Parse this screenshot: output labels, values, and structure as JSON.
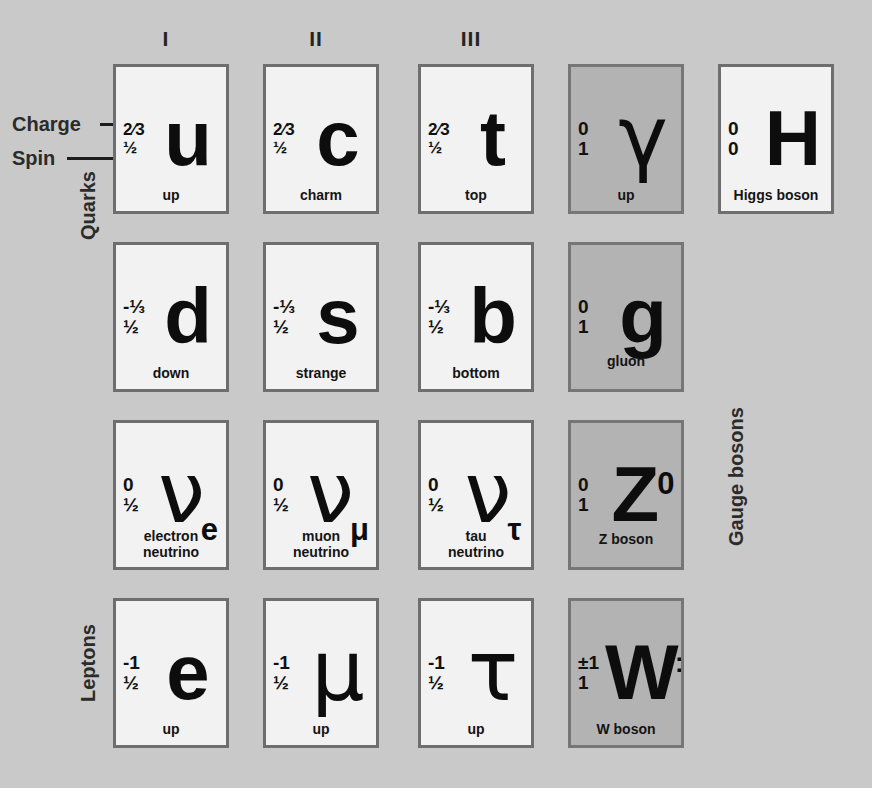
{
  "diagram": {
    "background_color": "#c9c9c9",
    "fermion_card_color": "#f2f2f2",
    "boson_card_color": "#b3b3b3",
    "border_color": "#6e6e6e"
  },
  "annotations": {
    "charge_label": "Charge",
    "spin_label": "Spin"
  },
  "group_labels": {
    "quarks": "Quarks",
    "leptons": "Leptons",
    "gauge_bosons": "Gauge bosons"
  },
  "columns": [
    {
      "header": "I"
    },
    {
      "header": "II"
    },
    {
      "header": "III"
    },
    {
      "header": ""
    },
    {
      "header": ""
    }
  ],
  "particles": [
    {
      "id": "up-quark",
      "symbol": "u",
      "sup": "",
      "sub": "",
      "charge": "2⁄3",
      "spin": "½",
      "name": "up",
      "name_line2": "",
      "type": "fermion",
      "group": "quark",
      "col": 0,
      "row": 0
    },
    {
      "id": "charm-quark",
      "symbol": "c",
      "sup": "",
      "sub": "",
      "charge": "2⁄3",
      "spin": "½",
      "name": "charm",
      "name_line2": "",
      "type": "fermion",
      "group": "quark",
      "col": 1,
      "row": 0
    },
    {
      "id": "top-quark",
      "symbol": "t",
      "sup": "",
      "sub": "",
      "charge": "2⁄3",
      "spin": "½",
      "name": "top",
      "name_line2": "",
      "type": "fermion",
      "group": "quark",
      "col": 2,
      "row": 0
    },
    {
      "id": "photon",
      "symbol": "γ",
      "sup": "",
      "sub": "",
      "charge": "0",
      "spin": "1",
      "name": "up",
      "name_line2": "",
      "type": "boson",
      "group": "gauge-boson",
      "col": 3,
      "row": 0
    },
    {
      "id": "higgs-boson",
      "symbol": "H",
      "sup": "",
      "sub": "",
      "charge": "0",
      "spin": "0",
      "name": "Higgs boson",
      "name_line2": "",
      "type": "fermion",
      "group": "scalar-boson",
      "col": 4,
      "row": 0
    },
    {
      "id": "down-quark",
      "symbol": "d",
      "sup": "",
      "sub": "",
      "charge": "-⅓",
      "spin": "½",
      "name": "down",
      "name_line2": "",
      "type": "fermion",
      "group": "quark",
      "col": 0,
      "row": 1
    },
    {
      "id": "strange-quark",
      "symbol": "s",
      "sup": "",
      "sub": "",
      "charge": "-⅓",
      "spin": "½",
      "name": "strange",
      "name_line2": "",
      "type": "fermion",
      "group": "quark",
      "col": 1,
      "row": 1
    },
    {
      "id": "bottom-quark",
      "symbol": "b",
      "sup": "",
      "sub": "",
      "charge": "-⅓",
      "spin": "½",
      "name": "bottom",
      "name_line2": "",
      "type": "fermion",
      "group": "quark",
      "col": 2,
      "row": 1
    },
    {
      "id": "gluon",
      "symbol": "g",
      "sup": "",
      "sub": "",
      "charge": "0",
      "spin": "1",
      "name": "gluon",
      "name_line2": "",
      "type": "boson",
      "group": "gauge-boson",
      "col": 3,
      "row": 1
    },
    {
      "id": "electron-neutrino",
      "symbol": "ν",
      "sup": "",
      "sub": "e",
      "charge": "0",
      "spin": "½",
      "name": "electron",
      "name_line2": "neutrino",
      "type": "fermion",
      "group": "lepton",
      "col": 0,
      "row": 2
    },
    {
      "id": "muon-neutrino",
      "symbol": "ν",
      "sup": "",
      "sub": "μ",
      "charge": "0",
      "spin": "½",
      "name": "muon",
      "name_line2": "neutrino",
      "type": "fermion",
      "group": "lepton",
      "col": 1,
      "row": 2
    },
    {
      "id": "tau-neutrino",
      "symbol": "ν",
      "sup": "",
      "sub": "τ",
      "charge": "0",
      "spin": "½",
      "name": "tau",
      "name_line2": "neutrino",
      "type": "fermion",
      "group": "lepton",
      "col": 2,
      "row": 2
    },
    {
      "id": "z-boson",
      "symbol": "Z",
      "sup": "0",
      "sub": "",
      "charge": "0",
      "spin": "1",
      "name": "Z boson",
      "name_line2": "",
      "type": "boson",
      "group": "gauge-boson",
      "col": 3,
      "row": 2
    },
    {
      "id": "electron",
      "symbol": "e",
      "sup": "",
      "sub": "",
      "charge": "-1",
      "spin": "½",
      "name": "up",
      "name_line2": "",
      "type": "fermion",
      "group": "lepton",
      "col": 0,
      "row": 3
    },
    {
      "id": "muon",
      "symbol": "μ",
      "sup": "",
      "sub": "",
      "charge": "-1",
      "spin": "½",
      "name": "up",
      "name_line2": "",
      "type": "fermion",
      "group": "lepton",
      "col": 1,
      "row": 3
    },
    {
      "id": "tau",
      "symbol": "τ",
      "sup": "",
      "sub": "",
      "charge": "-1",
      "spin": "½",
      "name": "up",
      "name_line2": "",
      "type": "fermion",
      "group": "lepton",
      "col": 2,
      "row": 3
    },
    {
      "id": "w-boson",
      "symbol": "W",
      "sup": "±",
      "sub": "",
      "charge": "±1",
      "spin": "1",
      "name": "W boson",
      "name_line2": "",
      "type": "boson",
      "group": "gauge-boson",
      "col": 3,
      "row": 3
    }
  ]
}
